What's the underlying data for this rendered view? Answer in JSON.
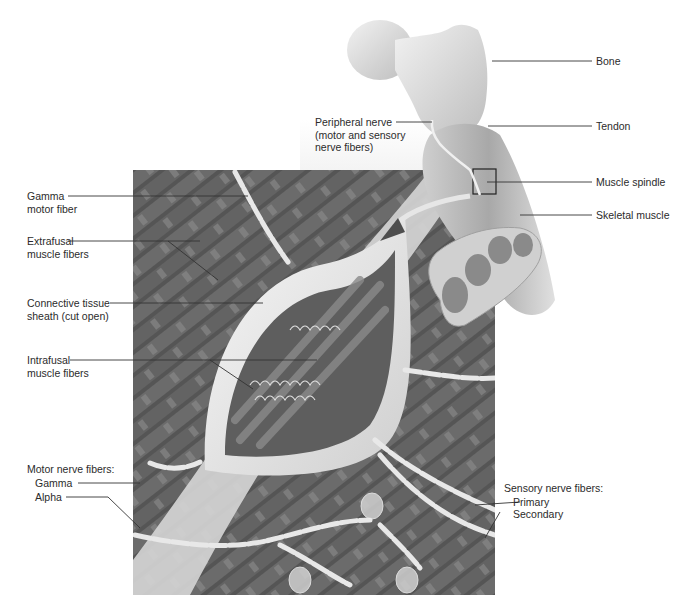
{
  "figure": {
    "palette": {
      "background": "#ffffff",
      "muscle_dark": "#4a4a4a",
      "muscle_mid": "#6e6e6e",
      "sheath": "#e6e6e6",
      "bone": "#d9d9d9",
      "leader_line": "#333333",
      "label_text": "#2b2b2b"
    }
  },
  "labels": {
    "bone": "Bone",
    "tendon": "Tendon",
    "muscle_spindle": "Muscle spindle",
    "skeletal_muscle": "Skeletal muscle",
    "peripheral_nerve": [
      "Peripheral nerve",
      "(motor and sensory",
      "nerve fibers)"
    ],
    "gamma_motor_fiber": [
      "Gamma",
      "motor fiber"
    ],
    "extrafusal": [
      "Extrafusal",
      "muscle fibers"
    ],
    "connective_sheath": [
      "Connective tissue",
      "sheath (cut open)"
    ],
    "intrafusal": [
      "Intrafusal",
      "muscle fibers"
    ],
    "motor_nerve_fibers": {
      "title": "Motor nerve fibers:",
      "gamma": "Gamma",
      "alpha": "Alpha"
    },
    "sensory_nerve_fibers": {
      "title": "Sensory nerve fibers:",
      "primary": "Primary",
      "secondary": "Secondary"
    }
  }
}
